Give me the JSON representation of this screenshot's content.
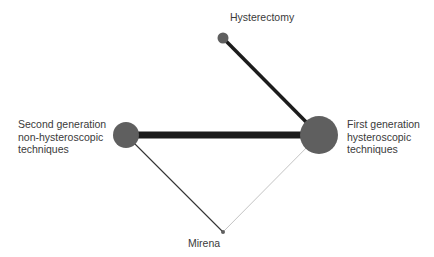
{
  "diagram": {
    "type": "network-meta-analysis",
    "nodes": [
      {
        "id": "hysterectomy",
        "label_lines": [
          "Hysterectomy"
        ],
        "x": 223,
        "y": 38,
        "r": 5.5
      },
      {
        "id": "second_gen",
        "label_lines": [
          "Second generation",
          "non-hysteroscopic",
          "techniques"
        ],
        "x": 126,
        "y": 135,
        "r": 13
      },
      {
        "id": "first_gen",
        "label_lines": [
          "First generation",
          "hysteroscopic",
          "techniques"
        ],
        "x": 319,
        "y": 135,
        "r": 19
      },
      {
        "id": "mirena",
        "label_lines": [
          "Mirena"
        ],
        "x": 223,
        "y": 232,
        "r": 2
      }
    ],
    "edges": [
      {
        "from": "hysterectomy",
        "to": "first_gen",
        "width": 3.5,
        "color": "#1c1c1c"
      },
      {
        "from": "second_gen",
        "to": "first_gen",
        "width": 7,
        "color": "#1a1a1a"
      },
      {
        "from": "second_gen",
        "to": "mirena",
        "width": 1.1,
        "color": "#333333"
      },
      {
        "from": "first_gen",
        "to": "mirena",
        "width": 0.6,
        "color": "#9a9a9a"
      }
    ],
    "node_color": "#5f5f5f",
    "labels": {
      "hysterectomy": {
        "lines": [
          "Hysterectomy"
        ],
        "left": 230,
        "top": 11
      },
      "second_gen": {
        "lines": [
          "Second generation",
          "non-hysteroscopic",
          "techniques"
        ],
        "left": 18,
        "top": 118
      },
      "first_gen": {
        "lines": [
          "First generation",
          "hysteroscopic",
          "techniques"
        ],
        "left": 347,
        "top": 118
      },
      "mirena": {
        "lines": [
          "Mirena"
        ],
        "left": 188,
        "top": 237
      }
    }
  }
}
